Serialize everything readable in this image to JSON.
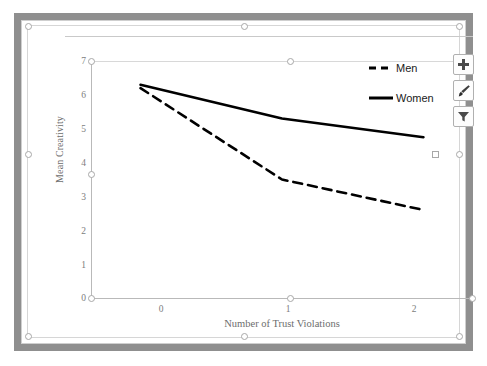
{
  "chart_data": {
    "type": "line",
    "title": "",
    "xlabel": "Number of Trust Violations",
    "ylabel": "Mean Creativity",
    "categories": [
      "0",
      "1",
      "2"
    ],
    "x": [
      0,
      1,
      2
    ],
    "xlim": [
      -0.35,
      2.35
    ],
    "ylim": [
      0,
      7
    ],
    "yticks": [
      "0",
      "1",
      "2",
      "3",
      "4",
      "5",
      "6",
      "7"
    ],
    "xticks": [
      "0",
      "1",
      "2"
    ],
    "grid": false,
    "legend_position": "top-right",
    "series": [
      {
        "name": "Men",
        "style": "dashed",
        "color": "#000000",
        "values": [
          6.2,
          3.5,
          2.6
        ]
      },
      {
        "name": "Women",
        "style": "solid",
        "color": "#000000",
        "values": [
          6.3,
          5.3,
          4.75
        ]
      }
    ]
  },
  "chart": {
    "y_axis": {
      "title": "Mean Creativity",
      "ticks": [
        "7",
        "6",
        "5",
        "4",
        "3",
        "2",
        "1",
        "0"
      ]
    },
    "x_axis": {
      "title": "Number of Trust Violations",
      "ticks": [
        "0",
        "1",
        "2"
      ]
    },
    "legend": {
      "items": [
        {
          "label": "Men",
          "style": "dashed"
        },
        {
          "label": "Women",
          "style": "solid"
        }
      ]
    }
  },
  "chart_tools": {
    "buttons": [
      {
        "name": "chart-elements-button",
        "icon": "plus-icon",
        "tooltip": "Chart Elements"
      },
      {
        "name": "chart-styles-button",
        "icon": "brush-icon",
        "tooltip": "Chart Styles"
      },
      {
        "name": "chart-filters-button",
        "icon": "funnel-icon",
        "tooltip": "Chart Filters"
      }
    ]
  }
}
